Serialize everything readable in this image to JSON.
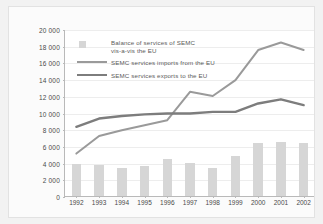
{
  "chart_data": {
    "type": "bar",
    "title": "",
    "subtitle": "",
    "xlabel": "",
    "ylabel": "",
    "categories": [
      "1992",
      "1993",
      "1994",
      "1995",
      "1996",
      "1997",
      "1998",
      "1999",
      "2000",
      "2001",
      "2002"
    ],
    "ylim": [
      0,
      20000
    ],
    "ytick_values": [
      0,
      2000,
      4000,
      6000,
      8000,
      10000,
      12000,
      14000,
      16000,
      18000,
      20000
    ],
    "ytick_labels": [
      "0",
      "2 000",
      "4 000",
      "6 000",
      "8 000",
      "10 000",
      "12 000",
      "14 000",
      "16 000",
      "18 000",
      "20 000"
    ],
    "grid": true,
    "legend_position": "upper-left-inside",
    "series": [
      {
        "name": "Balance of services of SEMC vis-a-vis the EU",
        "type": "bar",
        "color": "#d6d6d6",
        "values": [
          3800,
          3700,
          3300,
          3600,
          4400,
          4000,
          3400,
          4800,
          6400,
          6500,
          6300
        ]
      },
      {
        "name": "SEMC services imports from the EU",
        "type": "line",
        "color": "#9a9a9a",
        "values": [
          5200,
          7300,
          8000,
          8600,
          9200,
          12600,
          12100,
          14000,
          17600,
          18500,
          17600
        ]
      },
      {
        "name": "SEMC services exports to the EU",
        "type": "line",
        "color": "#7d7d7d",
        "values": [
          8400,
          9400,
          9700,
          9900,
          10000,
          10000,
          10200,
          10200,
          11200,
          11700,
          11000
        ]
      }
    ]
  },
  "legend": {
    "items": [
      {
        "key": "box",
        "label_line1": "Balance of services of SEMC",
        "label_line2": "vis-a-vis the EU"
      },
      {
        "key": "line",
        "label_line1": "SEMC services imports from the EU",
        "label_line2": ""
      },
      {
        "key": "line",
        "label_line1": "SEMC services exports to the EU",
        "label_line2": ""
      }
    ]
  }
}
